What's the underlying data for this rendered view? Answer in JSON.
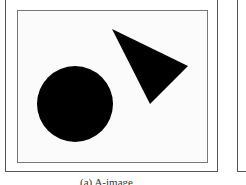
{
  "figure": {
    "caption": "(a) A-image",
    "panel": {
      "shapes": [
        {
          "type": "circle",
          "cx": 75,
          "cy": 104,
          "r": 38,
          "fill": "#000000"
        },
        {
          "type": "triangle",
          "points": "112,29 188,66 150,104",
          "fill": "#000000"
        }
      ]
    }
  }
}
